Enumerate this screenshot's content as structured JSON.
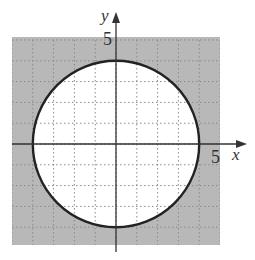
{
  "chart_data": {
    "type": "region",
    "title": "",
    "xlabel": "x",
    "ylabel": "y",
    "xlim": [
      -5,
      5
    ],
    "ylim": [
      -5,
      5
    ],
    "grid": true,
    "grid_step": 1,
    "tick_labels": {
      "x": [
        "5"
      ],
      "y": [
        "5"
      ]
    },
    "curves": [
      {
        "kind": "circle",
        "center": [
          0,
          0
        ],
        "radius": 4,
        "line_style": "solid"
      }
    ],
    "shaded_region": "outside circle",
    "colors": {
      "shade": "#b8b8b8",
      "boundary": "#222222",
      "axis": "#333333",
      "grid": "#888888"
    }
  },
  "labels": {
    "x_axis": "x",
    "y_axis": "y",
    "x_tick": "5",
    "y_tick": "5"
  }
}
